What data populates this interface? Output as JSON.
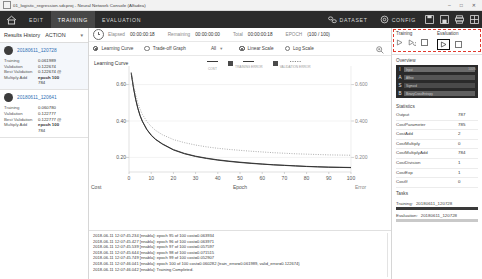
{
  "titlebar": {
    "title": "01_logistic_regression.sdcproj - Neural Network Console (Alfadea)",
    "minimize": "–",
    "maximize": "□",
    "close": "✕",
    "window_icon": "document-icon"
  },
  "menubar": {
    "home_icon": "home-icon",
    "items": [
      {
        "label": "EDIT",
        "active": false
      },
      {
        "label": "TRAINING",
        "active": true
      },
      {
        "label": "EVALUATION",
        "active": false
      }
    ],
    "dataset": "DATASET",
    "config": "CONFIG",
    "icons": [
      "save-icon",
      "save-as-icon",
      "print-icon",
      "layout-icon"
    ]
  },
  "results_history": {
    "title": "Results History",
    "action": "ACTION",
    "caret": "▼",
    "cards": [
      {
        "name": "20180611_120728",
        "selected": true,
        "rows": [
          {
            "key": "Training",
            "value": "0.061989"
          },
          {
            "key": "Validation",
            "value": "0.122674"
          },
          {
            "key": "Best Validation",
            "value": "0.122674 @"
          },
          {
            "key": "Multiply Add",
            "value": "epoch 100",
            "sub": "784"
          }
        ]
      },
      {
        "name": "20180611_120641",
        "selected": false,
        "rows": [
          {
            "key": "Training",
            "value": "0.060780"
          },
          {
            "key": "Validation",
            "value": "0.122777"
          },
          {
            "key": "Best Validation",
            "value": "0.122777 @"
          },
          {
            "key": "Multiply Add",
            "value": "epoch 100",
            "sub": "784"
          }
        ]
      }
    ]
  },
  "status": {
    "clock_icon": "clock-icon",
    "elapsed_label": "Elapsed",
    "elapsed_value": "00:00:00:18",
    "remaining_label": "Remaining",
    "remaining_value": "00:00:00:00",
    "total_label": "Total",
    "total_value": "00:00:00:18",
    "epoch_label": "EPOCH",
    "epoch_value": "(100 / 100)"
  },
  "options": {
    "learning_curve": "Learning Curve",
    "tradeoff_graph": "Trade-off Graph",
    "filter_value": "All",
    "filter_caret": "▼",
    "linear_scale": "Linear Scale",
    "log_scale": "Log Scale",
    "zoom_icon": "zoom-in-icon"
  },
  "chart_data": {
    "type": "line",
    "title": "Learning Curve",
    "xlabel": "Epoch",
    "ylabel": "Cost",
    "y2label": "Error",
    "xlim": [
      0,
      100
    ],
    "ylim": [
      0.12,
      0.68
    ],
    "y2lim": [
      0.12,
      0.68
    ],
    "xticks": [
      0,
      10,
      20,
      30,
      40,
      50,
      60,
      70,
      80,
      90,
      100
    ],
    "xticklabels": [
      "0",
      "10",
      "20",
      "30",
      "40",
      "50",
      "60",
      "70",
      "80",
      "90",
      "100"
    ],
    "yticks": [
      0.2,
      0.4,
      0.6
    ],
    "yticklabels": [
      "0.20",
      "0.40",
      "0.60"
    ],
    "y2ticks": [
      0.2,
      0.4,
      0.6
    ],
    "y2ticklabels": [
      "0.200",
      "0.400",
      "0.600"
    ],
    "grid": true,
    "legend_position": "top-center",
    "legend": [
      "COST",
      "TRAINING ERROR",
      "VALIDATION ERROR"
    ],
    "series": [
      {
        "name": "COST",
        "style": "solid",
        "color": "#3a3a3a",
        "x": [
          1,
          2,
          3,
          4,
          5,
          6,
          8,
          10,
          12,
          15,
          20,
          25,
          30,
          35,
          40,
          45,
          50,
          55,
          60,
          65,
          70,
          75,
          80,
          85,
          90,
          95,
          100
        ],
        "values": [
          0.665,
          0.585,
          0.52,
          0.47,
          0.43,
          0.4,
          0.355,
          0.323,
          0.3,
          0.275,
          0.243,
          0.222,
          0.207,
          0.196,
          0.187,
          0.18,
          0.174,
          0.169,
          0.164,
          0.16,
          0.157,
          0.154,
          0.151,
          0.149,
          0.147,
          0.146,
          0.145
        ]
      },
      {
        "name": "TRAINING ERROR",
        "style": "solid",
        "color": "#2f2f2f",
        "x": [
          1,
          2,
          3,
          4,
          5,
          6,
          8,
          10,
          12,
          15,
          20,
          25,
          30,
          35,
          40,
          45,
          50,
          55,
          60,
          65,
          70,
          75,
          80,
          85,
          90,
          95,
          100
        ],
        "values": [
          0.66,
          0.582,
          0.518,
          0.468,
          0.428,
          0.398,
          0.353,
          0.321,
          0.298,
          0.273,
          0.241,
          0.22,
          0.205,
          0.194,
          0.185,
          0.178,
          0.172,
          0.167,
          0.163,
          0.159,
          0.156,
          0.153,
          0.15,
          0.148,
          0.146,
          0.145,
          0.144
        ]
      },
      {
        "name": "VALIDATION ERROR",
        "style": "dotted",
        "color": "#8a8a8a",
        "x": [
          1,
          2,
          3,
          4,
          5,
          6,
          8,
          10,
          12,
          15,
          20,
          25,
          30,
          35,
          40,
          45,
          50,
          55,
          60,
          65,
          70,
          75,
          80,
          85,
          90,
          95,
          100
        ],
        "values": [
          0.668,
          0.6,
          0.545,
          0.5,
          0.465,
          0.437,
          0.398,
          0.37,
          0.348,
          0.325,
          0.298,
          0.281,
          0.268,
          0.258,
          0.25,
          0.244,
          0.239,
          0.234,
          0.23,
          0.226,
          0.223,
          0.22,
          0.218,
          0.216,
          0.214,
          0.213,
          0.212
        ]
      }
    ]
  },
  "log": {
    "lines": [
      "2018-06-11 12:07:45.234 [nnabla]: epoch 95 of 100 cost=0.063934",
      "2018-06-11 12:07:45.427 [nnabla]: epoch 96 of 100 cost=0.063971",
      "2018-06-11 12:07:45.539 [nnabla]: epoch 97 of 100 cost=0.057597",
      "2018-06-11 12:07:45.644 [nnabla]: epoch 98 of 100 cost=0.071515",
      "2018-06-11 12:07:45.749 [nnabla]: epoch 99 of 100 cost=0.052907",
      "2018-06-11 12:07:46.041 [nnabla]: epoch 100 of 100 cost=0.060282  {train_error=0.061989, valid_error=0.122674}",
      "2018-06-11 12:07:46.042 [nnabla]: Training Completed."
    ]
  },
  "right_panel": {
    "training_label": "Training",
    "evaluation_label": "Evaluation",
    "training_icons": [
      "play-icon",
      "resume-icon",
      "stop-icon"
    ],
    "evaluation_icons": [
      "play-icon",
      "stop-icon"
    ],
    "overview_label": "Overview",
    "overview_layers": [
      {
        "letter": "I",
        "name": "Input"
      },
      {
        "letter": "A",
        "name": "Affine"
      },
      {
        "letter": "S",
        "name": "Sigmoid"
      },
      {
        "letter": "B",
        "name": "BinaryCrossEntropy"
      }
    ],
    "overview_note": "100%",
    "statistics_label": "Statistics",
    "statistics": [
      {
        "key": "Output",
        "value": "787"
      },
      {
        "key": "CostParameter",
        "value": "785"
      },
      {
        "key": "CostAdd",
        "value": "2"
      },
      {
        "key": "CostMultiply",
        "value": "0"
      },
      {
        "key": "CostMultiplyAdd",
        "value": "784"
      },
      {
        "key": "CostDivision",
        "value": "1"
      },
      {
        "key": "CostExp",
        "value": "1"
      },
      {
        "key": "CostIf",
        "value": "0"
      }
    ],
    "tasks_label": "Tasks",
    "tasks": [
      {
        "key": "Training:",
        "value": "20180611_120728",
        "progress": "full"
      },
      {
        "key": "Evaluation:",
        "value": "20180611_120728",
        "progress": "light"
      }
    ]
  }
}
